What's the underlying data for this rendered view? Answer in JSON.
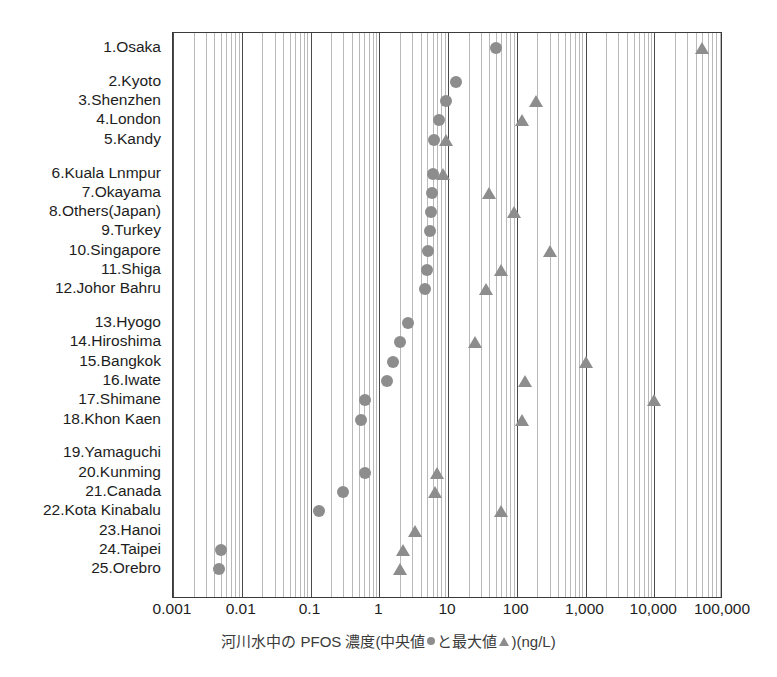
{
  "chart_data": {
    "type": "scatter",
    "title": "",
    "xlabel_parts": {
      "pre": "河川水中の PFOS 濃度(中央値",
      "mid": "と最大値",
      "post": ")(ng/L)"
    },
    "xlabel": "河川水中の PFOS 濃度(中央値●と最大値▲)(ng/L)",
    "ylabel": "",
    "xscale": "log",
    "xlim": [
      0.001,
      100000
    ],
    "grid": true,
    "legend": {
      "position": "in-axis-caption",
      "entries": [
        {
          "name": "中央値 (median)",
          "marker": "circle",
          "color": "#8d8d8d"
        },
        {
          "name": "最大値 (maximum)",
          "marker": "triangle",
          "color": "#8d8d8d"
        }
      ]
    },
    "xticks": [
      {
        "value": 0.001,
        "label": "0.001"
      },
      {
        "value": 0.01,
        "label": "0.01"
      },
      {
        "value": 0.1,
        "label": "0.1"
      },
      {
        "value": 1,
        "label": "1"
      },
      {
        "value": 10,
        "label": "10"
      },
      {
        "value": 100,
        "label": "100"
      },
      {
        "value": 1000,
        "label": "1,000"
      },
      {
        "value": 10000,
        "label": "10,000"
      },
      {
        "value": 100000,
        "label": "100,000"
      }
    ],
    "categories": [
      "1.Osaka",
      "2.Kyoto",
      "3.Shenzhen",
      "4.London",
      "5.Kandy",
      "6.Kuala Lnmpur",
      "7.Okayama",
      "8.Others(Japan)",
      "9.Turkey",
      "10.Singapore",
      "11.Shiga",
      "12.Johor Bahru",
      "13.Hyogo",
      "14.Hiroshima",
      "15.Bangkok",
      "16.Iwate",
      "17.Shimane",
      "18.Khon Kaen",
      "19.Yamaguchi",
      "20.Kunming",
      "21.Canada",
      "22.Kota Kinabalu",
      "23.Hanoi",
      "24.Taipei",
      "25.Orebro"
    ],
    "series": [
      {
        "name": "中央値",
        "marker": "circle",
        "color": "#8d8d8d",
        "values": [
          50,
          13,
          9.5,
          7.5,
          6.2,
          6.0,
          5.8,
          5.6,
          5.4,
          5.2,
          5.0,
          4.6,
          2.6,
          2.0,
          1.6,
          1.3,
          0.62,
          0.55,
          null,
          0.62,
          0.3,
          0.135,
          null,
          0.005,
          0.0047
        ]
      },
      {
        "name": "最大値",
        "marker": "triangle",
        "color": "#8d8d8d",
        "values": [
          50000,
          null,
          190,
          120,
          9.5,
          8.5,
          40,
          90,
          null,
          300,
          60,
          36,
          null,
          25,
          1000,
          130,
          10000,
          120,
          null,
          7.0,
          6.4,
          60,
          3.3,
          2.2,
          2.0
        ]
      }
    ],
    "group_breaks": [
      1,
      5,
      12,
      18
    ]
  }
}
